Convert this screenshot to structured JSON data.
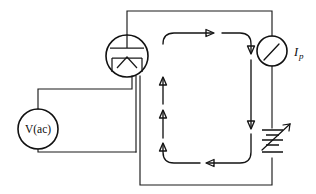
{
  "figure": {
    "name": "vacuum-diode-rectifier-circuit",
    "caption": "",
    "width": 316,
    "height": 194,
    "background_color": "#ffffff",
    "line_color": "#1a1a1a"
  },
  "components": {
    "ac_source": {
      "label": "V(ac)",
      "symbol": "circle-source",
      "center_x": 38,
      "center_y": 129,
      "radius": 20
    },
    "vacuum_tube": {
      "label": "",
      "symbol": "vacuum-diode-tube",
      "center_x": 127,
      "center_y": 56,
      "radius": 21,
      "anode_label": "",
      "cathode_label": ""
    },
    "ammeter": {
      "label": "Ip",
      "label_main": "I",
      "label_sub": "p",
      "symbol": "meter-circle-with-needle",
      "center_x": 272,
      "center_y": 51,
      "radius": 15
    },
    "battery": {
      "label": "",
      "symbol": "variable-battery",
      "center_x": 272,
      "center_y": 143,
      "plate_count": 4,
      "has_variable_arrow": true
    }
  },
  "current_flow": {
    "label": "",
    "direction": "clockwise",
    "arrow_count": 6,
    "arrows": [
      {
        "name": "top-left-arrow",
        "direction": "right"
      },
      {
        "name": "top-right-arrow",
        "direction": "right"
      },
      {
        "name": "right-down-arrow",
        "direction": "down"
      },
      {
        "name": "bottom-arrow",
        "direction": "left"
      },
      {
        "name": "left-lower-arrow",
        "direction": "up"
      },
      {
        "name": "left-upper-arrow",
        "direction": "up"
      }
    ]
  },
  "colors": {
    "stroke": "#1a1a1a",
    "background": "#ffffff"
  }
}
